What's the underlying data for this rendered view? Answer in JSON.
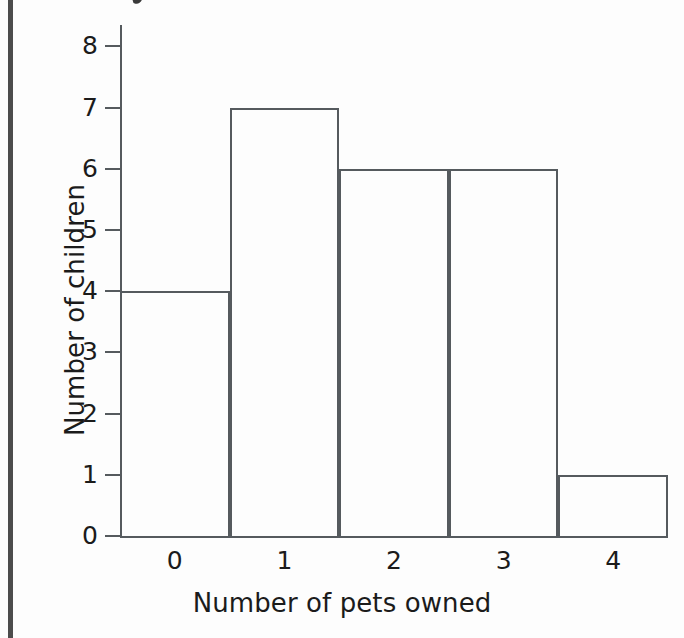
{
  "chart_data": {
    "type": "bar",
    "title": "",
    "subtitle": "",
    "xlabel": "Number of pets owned",
    "ylabel": "Number of children",
    "categories": [
      "0",
      "1",
      "2",
      "3",
      "4"
    ],
    "values": [
      4,
      7,
      6,
      6,
      1
    ],
    "series": [
      {
        "name": "Number of children",
        "values": [
          4,
          7,
          6,
          6,
          1
        ]
      }
    ],
    "xlim": [
      -0.5,
      4.5
    ],
    "ylim": [
      0,
      8
    ],
    "y_ticks": [
      "8",
      "7",
      "6",
      "5",
      "4",
      "3",
      "2",
      "1",
      "0"
    ],
    "y_tick_values": [
      8,
      7,
      6,
      5,
      4,
      3,
      2,
      1,
      0
    ],
    "x_ticks": [
      "0",
      "1",
      "2",
      "3",
      "4"
    ],
    "grid": false,
    "legend": false,
    "legend_position": "none",
    "bar_style": "outline",
    "bar_gap": 0,
    "annotations": []
  },
  "style": {
    "background": "#fdfdfd",
    "line_color": "#555a5e",
    "text_color": "#1b1b1b",
    "gutter_rule_color": "#4c4c4c"
  }
}
